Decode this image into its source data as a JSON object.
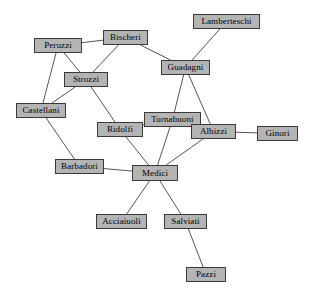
{
  "diagram": {
    "type": "undirected-graph",
    "canvas": {
      "width": 310,
      "height": 298,
      "background": "#ffffff"
    },
    "style": {
      "node_fill": "#b4b4b4",
      "node_border": "#3a3a3a",
      "edge_color": "#555555",
      "label_color": "#000000"
    },
    "nodes": [
      {
        "id": "lamberteschi",
        "label": "Lamberteschi",
        "x": 193,
        "y": 14,
        "w": 67,
        "h": 15
      },
      {
        "id": "bischeri",
        "label": "Bischeri",
        "x": 103,
        "y": 30,
        "w": 45,
        "h": 15
      },
      {
        "id": "peruzzi",
        "label": "Peruzzi",
        "x": 34,
        "y": 38,
        "w": 48,
        "h": 15
      },
      {
        "id": "guadagni",
        "label": "Guadagni",
        "x": 161,
        "y": 60,
        "w": 49,
        "h": 15
      },
      {
        "id": "strozzi",
        "label": "Strozzi",
        "x": 64,
        "y": 72,
        "w": 44,
        "h": 15
      },
      {
        "id": "castellani",
        "label": "Castellani",
        "x": 16,
        "y": 103,
        "w": 50,
        "h": 15
      },
      {
        "id": "tornabuoni",
        "label": "Tornabuoni",
        "x": 144,
        "y": 112,
        "w": 57,
        "h": 15
      },
      {
        "id": "ridolfi",
        "label": "Ridolfi",
        "x": 97,
        "y": 122,
        "w": 46,
        "h": 15
      },
      {
        "id": "albizzi",
        "label": "Albizzi",
        "x": 191,
        "y": 124,
        "w": 45,
        "h": 15
      },
      {
        "id": "ginori",
        "label": "Ginori",
        "x": 257,
        "y": 126,
        "w": 41,
        "h": 15
      },
      {
        "id": "barbadori",
        "label": "Barbadori",
        "x": 55,
        "y": 159,
        "w": 49,
        "h": 15
      },
      {
        "id": "medici",
        "label": "Medici",
        "x": 132,
        "y": 165,
        "w": 46,
        "h": 16
      },
      {
        "id": "acciaiuoli",
        "label": "Acciaiuoli",
        "x": 96,
        "y": 214,
        "w": 51,
        "h": 15
      },
      {
        "id": "salviati",
        "label": "Salviati",
        "x": 164,
        "y": 214,
        "w": 43,
        "h": 15
      },
      {
        "id": "pazzi",
        "label": "Pazzi",
        "x": 186,
        "y": 267,
        "w": 40,
        "h": 15
      }
    ],
    "edges": [
      {
        "source": "peruzzi",
        "target": "bischeri"
      },
      {
        "source": "peruzzi",
        "target": "strozzi"
      },
      {
        "source": "peruzzi",
        "target": "castellani"
      },
      {
        "source": "bischeri",
        "target": "strozzi"
      },
      {
        "source": "bischeri",
        "target": "guadagni"
      },
      {
        "source": "lamberteschi",
        "target": "guadagni"
      },
      {
        "source": "guadagni",
        "target": "tornabuoni"
      },
      {
        "source": "guadagni",
        "target": "albizzi"
      },
      {
        "source": "strozzi",
        "target": "castellani"
      },
      {
        "source": "strozzi",
        "target": "ridolfi"
      },
      {
        "source": "castellani",
        "target": "barbadori"
      },
      {
        "source": "tornabuoni",
        "target": "ridolfi"
      },
      {
        "source": "tornabuoni",
        "target": "albizzi"
      },
      {
        "source": "tornabuoni",
        "target": "medici"
      },
      {
        "source": "ridolfi",
        "target": "medici"
      },
      {
        "source": "albizzi",
        "target": "ginori"
      },
      {
        "source": "albizzi",
        "target": "medici"
      },
      {
        "source": "barbadori",
        "target": "medici"
      },
      {
        "source": "medici",
        "target": "acciaiuoli"
      },
      {
        "source": "medici",
        "target": "salviati"
      },
      {
        "source": "salviati",
        "target": "pazzi"
      }
    ]
  }
}
